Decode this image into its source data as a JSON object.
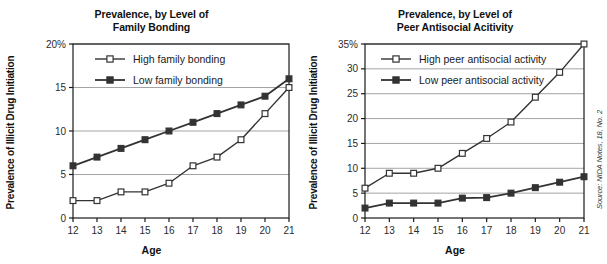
{
  "figure": {
    "source_note": "Source: NIDA Notes, 18, No. 2",
    "background": "#ffffff",
    "line_color": "#333333",
    "grid_color": "#9a9a9a",
    "axis_color": "#1a1a1a"
  },
  "panels": [
    {
      "title_line1": "Prevalence, by Level of",
      "title_line2": "Family Bonding",
      "ylabel": "Prevalence of Illicit Drug Initiation",
      "xlabel": "Age",
      "ytick_top_label": "20%",
      "chart_data": {
        "type": "line",
        "title": "Prevalence, by Level of Family Bonding",
        "xlabel": "Age",
        "ylabel": "Prevalence of Illicit Drug Initiation",
        "x": [
          12,
          13,
          14,
          15,
          16,
          17,
          18,
          19,
          20,
          21
        ],
        "xticklabels": [
          "12",
          "13",
          "14",
          "15",
          "16",
          "17",
          "18",
          "19",
          "20",
          "21"
        ],
        "yticks": [
          0,
          5,
          10,
          15,
          20
        ],
        "yticklabels": [
          "0",
          "5",
          "10",
          "15",
          "20%"
        ],
        "ylim": [
          0,
          20
        ],
        "xlim": [
          12,
          21
        ],
        "grid": "horizontal",
        "legend_position": "upper-left-inside",
        "series": [
          {
            "name": "High family bonding",
            "marker": "open-square",
            "values": [
              2,
              2,
              3,
              3,
              4,
              6,
              7,
              9,
              12,
              15
            ]
          },
          {
            "name": "Low family bonding",
            "marker": "filled-square",
            "values": [
              6,
              7,
              8,
              9,
              10,
              11,
              12,
              13,
              14,
              16
            ]
          }
        ]
      }
    },
    {
      "title_line1": "Prevalence, by Level of",
      "title_line2": "Peer Antisocial Acitivity",
      "ylabel": "Prevalence of Illicit Drug Initiation",
      "xlabel": "Age",
      "ytick_top_label": "35%",
      "chart_data": {
        "type": "line",
        "title": "Prevalence, by Level of Peer Antisocial Acitivity",
        "xlabel": "Age",
        "ylabel": "Prevalence of Illicit Drug Initiation",
        "x": [
          12,
          13,
          14,
          15,
          16,
          17,
          18,
          19,
          20,
          21
        ],
        "xticklabels": [
          "12",
          "13",
          "14",
          "15",
          "16",
          "17",
          "18",
          "19",
          "20",
          "21"
        ],
        "yticks": [
          0,
          5,
          10,
          15,
          20,
          25,
          30,
          35
        ],
        "yticklabels": [
          "0",
          "5",
          "10",
          "15",
          "20",
          "25",
          "30",
          "35%"
        ],
        "ylim": [
          0,
          35
        ],
        "xlim": [
          12,
          21
        ],
        "grid": "horizontal",
        "legend_position": "upper-left-inside",
        "series": [
          {
            "name": "High peer antisocial activity",
            "marker": "open-square",
            "values": [
              6,
              9,
              9,
              10,
              13,
              16,
              19.3,
              24.3,
              29.3,
              35
            ]
          },
          {
            "name": "Low peer antisocial activity",
            "marker": "filled-square",
            "values": [
              2,
              3,
              3,
              3,
              4,
              4.1,
              5,
              6.1,
              7.2,
              8.3
            ]
          }
        ]
      }
    }
  ]
}
